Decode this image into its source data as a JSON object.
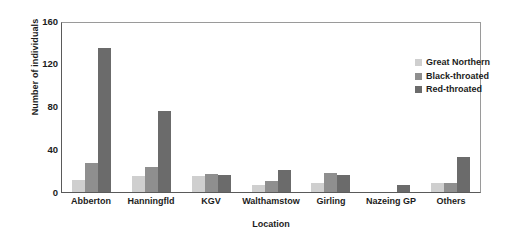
{
  "chart_data": {
    "type": "bar",
    "title": "",
    "xlabel": "Location",
    "ylabel": "Number of individuals",
    "categories": [
      "Abberton",
      "Hanningfld",
      "KGV",
      "Walthamstow",
      "Girling",
      "Nazeing GP",
      "Others"
    ],
    "series": [
      {
        "name": "Great Northern",
        "color": "#cfcfcf",
        "values": [
          11,
          15,
          15,
          7,
          9,
          0,
          9
        ]
      },
      {
        "name": "Black-throated",
        "color": "#8f8f8f",
        "values": [
          27,
          24,
          17,
          10,
          18,
          0,
          9
        ]
      },
      {
        "name": "Red-throated",
        "color": "#6b6b6b",
        "values": [
          136,
          77,
          16,
          21,
          16,
          7,
          33
        ]
      }
    ],
    "yticks": [
      160,
      120,
      80,
      40,
      0
    ],
    "ylim": [
      0,
      160
    ],
    "grid": false,
    "legend_position": "top-right"
  }
}
